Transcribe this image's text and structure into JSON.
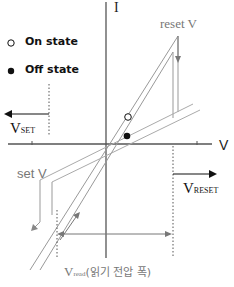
{
  "diagram": {
    "axes": {
      "x_label": "V",
      "y_label": "I"
    },
    "legend": [
      {
        "marker": "open-circle",
        "label": "On state"
      },
      {
        "marker": "filled-circle",
        "label": "Off state"
      }
    ],
    "annotations": {
      "reset": "reset V",
      "set": "set V",
      "v_set_main": "V",
      "v_set_sub": "SET",
      "v_reset_main": "V",
      "v_reset_sub": "RESET",
      "v_read_main": "V",
      "v_read_sub": "read",
      "v_read_desc": "(읽기 전압 폭)"
    },
    "colors": {
      "axis": "#555555",
      "curve": "#9a9a9a",
      "arrow": "#111111",
      "text_gray": "#777777"
    }
  }
}
